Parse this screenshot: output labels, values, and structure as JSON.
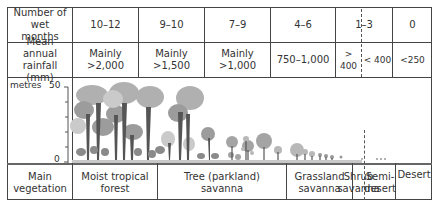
{
  "table": {
    "rows": [
      {
        "header": "Number of wet months",
        "cells": [
          "10–12",
          "9–10",
          "7–9",
          "4–6",
          "1–3",
          "0"
        ]
      },
      {
        "header": "Mean annual rainfall (mm)",
        "cells": [
          "Mainly >2,000",
          "Mainly >1,500",
          "Mainly >1,000",
          "750–1,000",
          "> 400",
          "< 400",
          "<250"
        ]
      }
    ],
    "chart": {
      "unit_label": "metres",
      "axis_max": "50",
      "axis_min": "0"
    },
    "vegetation": {
      "header": "Main vegetation",
      "cells": [
        "Moist tropical forest",
        "Tree (parkland) savanna",
        "Grassland savanna",
        "Shrub savanna",
        "Semi-desert",
        "Desert"
      ]
    }
  },
  "colors": {
    "line": "#444444",
    "canopy_dark": "#9a9a9a",
    "canopy_light": "#c4c4c4",
    "trunk": "#555555",
    "ground": "#b0b0b0"
  }
}
